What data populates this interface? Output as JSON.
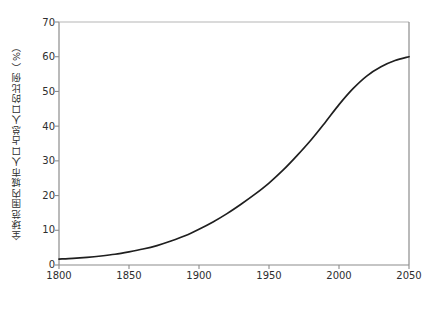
{
  "chart_data": {
    "type": "line",
    "title": "",
    "xlabel": "年份",
    "ylabel": "全球范围内城市人口占总人口的比例（%）",
    "xlim": [
      1800,
      2050
    ],
    "ylim": [
      0,
      70
    ],
    "grid": false,
    "legend": null,
    "xticks": [
      1800,
      1850,
      1900,
      1950,
      2000,
      2050
    ],
    "ytick_labels": [
      "0",
      "10",
      "20",
      "30",
      "40",
      "50",
      "60",
      "70"
    ],
    "yticks": [
      0,
      10,
      20,
      30,
      40,
      50,
      60,
      70
    ],
    "line_color": "#1f1f1f",
    "line_width": 1.7,
    "series": [
      {
        "name": "全球范围内城市人口占总人口的比例",
        "x": [
          1800,
          1810,
          1820,
          1830,
          1840,
          1850,
          1860,
          1870,
          1880,
          1890,
          1900,
          1910,
          1920,
          1930,
          1940,
          1950,
          1960,
          1970,
          1980,
          1990,
          2000,
          2010,
          2020,
          2030,
          2040,
          2050
        ],
        "values": [
          1.7,
          1.9,
          2.2,
          2.6,
          3.1,
          3.8,
          4.6,
          5.6,
          6.9,
          8.4,
          10.3,
          12.4,
          14.8,
          17.5,
          20.4,
          23.6,
          27.3,
          31.5,
          36.0,
          41.0,
          46.2,
          50.8,
          54.5,
          57.1,
          58.9,
          60.0
        ]
      }
    ]
  },
  "axes": {
    "y_title": "全球范围内城市人口占总人口的比例（%）",
    "x_title": "年份",
    "y_labels": [
      "70",
      "60",
      "50",
      "40",
      "30",
      "20",
      "10",
      "0"
    ],
    "x_labels": [
      "1800",
      "1850",
      "1900",
      "1950",
      "2000",
      "2050"
    ]
  }
}
